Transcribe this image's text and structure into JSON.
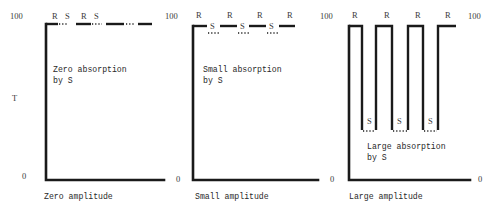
{
  "figure": {
    "y_axis_label": "T",
    "y_max_label": "100",
    "y_min_label": "0",
    "reference_label": "R",
    "sample_label": "S",
    "panels": [
      {
        "id": "zero",
        "amplitude_caption": "Zero amplitude",
        "absorption_caption_line1": "Zero absorption",
        "absorption_caption_line2": "by S",
        "top_labels": [
          "R",
          "S",
          "R",
          "S"
        ],
        "sample_transmittance_fraction": 1.0
      },
      {
        "id": "small",
        "amplitude_caption": "Small amplitude",
        "absorption_caption_line1": "Small absorption",
        "absorption_caption_line2": "by S",
        "top_labels": [
          "R",
          "R",
          "R",
          "R"
        ],
        "sample_labels": [
          "S",
          "S",
          "S"
        ],
        "sample_transmittance_fraction": 0.95
      },
      {
        "id": "large",
        "amplitude_caption": "Large amplitude",
        "absorption_caption_line1": "Large absorption",
        "absorption_caption_line2": "by S",
        "top_labels": [
          "R",
          "R",
          "R",
          "R"
        ],
        "sample_labels": [
          "S",
          "S",
          "S"
        ],
        "sample_transmittance_fraction": 0.3
      }
    ]
  }
}
